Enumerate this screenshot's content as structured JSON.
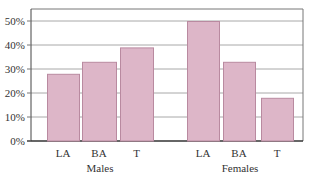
{
  "chart_data": {
    "type": "bar",
    "title": "",
    "xlabel": "",
    "ylabel": "",
    "ylim": [
      0,
      50
    ],
    "yticks": [
      "0%",
      "10%",
      "20%",
      "30%",
      "40%",
      "50%"
    ],
    "grid": true,
    "legend": null,
    "groups": [
      {
        "name": "Males",
        "categories": [
          "LA",
          "BA",
          "T"
        ],
        "values": [
          28,
          33,
          39
        ]
      },
      {
        "name": "Females",
        "categories": [
          "LA",
          "BA",
          "T"
        ],
        "values": [
          50,
          33,
          18
        ]
      }
    ],
    "categories": [
      "LA",
      "BA",
      "T",
      "LA",
      "BA",
      "T"
    ],
    "values": [
      28,
      33,
      39,
      50,
      33,
      18
    ],
    "unit": "%"
  },
  "style": {
    "bar_fill": "#ddb6c8",
    "bar_stroke": "#b98aa0",
    "grid_color": "#a8a8a8",
    "frame_color": "#777777"
  }
}
